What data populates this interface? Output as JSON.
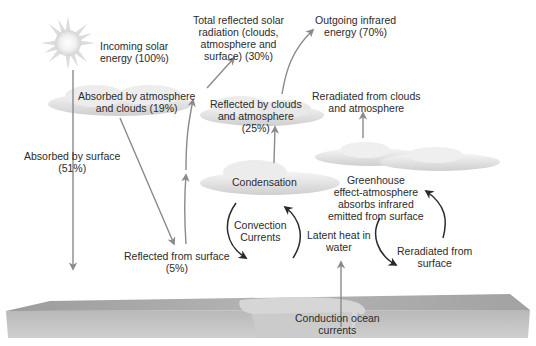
{
  "diagram": {
    "labels": {
      "incoming": [
        "Incoming solar",
        "energy (100%)"
      ],
      "absorbed_atmo": [
        "Absorbed by atmosphere",
        "and clouds (19%)"
      ],
      "total_reflected": [
        "Total reflected solar",
        "radiation (clouds,",
        "atmosphere and",
        "surface) (30%)"
      ],
      "outgoing_ir": [
        "Outgoing infrared",
        "energy (70%)"
      ],
      "reflected_clouds": [
        "Reflected by clouds",
        "and atmosphere",
        "(25%)"
      ],
      "reradiated_clouds": [
        "Reradiated from clouds",
        "and atmosphere"
      ],
      "absorbed_surface": [
        "Absorbed by surface",
        "(51%)"
      ],
      "condensation": [
        "Condensation"
      ],
      "greenhouse": [
        "Greenhouse",
        "effect-atmosphere",
        "absorbs infrared",
        "emitted from surface"
      ],
      "convection": [
        "Convection",
        "Currents"
      ],
      "latent_heat": [
        "Latent heat in",
        "water"
      ],
      "reflected_surface": [
        "Reflected from surface",
        "(5%)"
      ],
      "reradiated_surface": [
        "Reradiated from",
        "surface"
      ],
      "conduction": [
        "Conduction ocean",
        "currents"
      ]
    },
    "colors": {
      "arrow_gray": "#8a8a8a",
      "arrow_dark": "#2a2a2a",
      "ground": "#a9a9a9",
      "ocean": "#cfcfcf",
      "cloud": "#e2e2e2"
    }
  }
}
